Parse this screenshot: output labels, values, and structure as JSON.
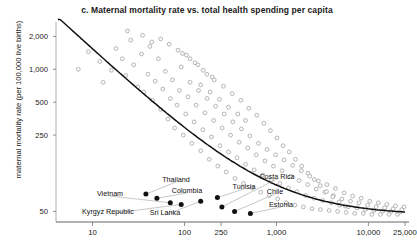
{
  "chart_data": {
    "type": "scatter",
    "title": "c. Maternal mortality rate vs. total health spending per capita",
    "xlabel": "",
    "ylabel": "maternal mortality rate (per 100,000 live births)",
    "xscale": "log",
    "yscale": "log",
    "xlim": [
      4,
      25000
    ],
    "ylim": [
      40,
      2600
    ],
    "grid": false,
    "legend": "none",
    "xticks": [
      10,
      100,
      250,
      1000,
      10000,
      25000
    ],
    "xtick_labels": [
      "10",
      "100",
      "250",
      "1,000",
      "10,000",
      "25,000"
    ],
    "yticks": [
      50,
      250,
      500,
      1000,
      2000
    ],
    "ytick_labels": [
      "50",
      "250",
      "500",
      "1,000",
      "2,000"
    ],
    "series": [
      {
        "name": "countries",
        "marker": "open-circle",
        "color": "#a8a8a8",
        "points": [
          [
            7,
            1000
          ],
          [
            9,
            1450
          ],
          [
            12,
            1180
          ],
          [
            13,
            760
          ],
          [
            16,
            980
          ],
          [
            18,
            1550
          ],
          [
            21,
            1250
          ],
          [
            23,
            880
          ],
          [
            26,
            1850
          ],
          [
            28,
            1100
          ],
          [
            31,
            690
          ],
          [
            34,
            1380
          ],
          [
            36,
            620
          ],
          [
            40,
            900
          ],
          [
            42,
            1620
          ],
          [
            45,
            520
          ],
          [
            48,
            780
          ],
          [
            52,
            1250
          ],
          [
            55,
            430
          ],
          [
            58,
            660
          ],
          [
            62,
            960
          ],
          [
            66,
            350
          ],
          [
            70,
            540
          ],
          [
            74,
            800
          ],
          [
            78,
            290
          ],
          [
            83,
            470
          ],
          [
            88,
            640
          ],
          [
            92,
            1050
          ],
          [
            97,
            250
          ],
          [
            103,
            390
          ],
          [
            109,
            560
          ],
          [
            115,
            760
          ],
          [
            120,
            210
          ],
          [
            127,
            330
          ],
          [
            134,
            470
          ],
          [
            142,
            640
          ],
          [
            150,
            180
          ],
          [
            158,
            280
          ],
          [
            167,
            400
          ],
          [
            176,
            540
          ],
          [
            186,
            150
          ],
          [
            196,
            240
          ],
          [
            207,
            340
          ],
          [
            218,
            460
          ],
          [
            230,
            130
          ],
          [
            243,
            200
          ],
          [
            256,
            290
          ],
          [
            270,
            390
          ],
          [
            285,
            115
          ],
          [
            301,
            175
          ],
          [
            317,
            250
          ],
          [
            335,
            330
          ],
          [
            353,
            100
          ],
          [
            373,
            155
          ],
          [
            393,
            215
          ],
          [
            415,
            285
          ],
          [
            438,
            90
          ],
          [
            462,
            135
          ],
          [
            487,
            190
          ],
          [
            514,
            245
          ],
          [
            542,
            82
          ],
          [
            572,
            120
          ],
          [
            604,
            165
          ],
          [
            637,
            210
          ],
          [
            672,
            75
          ],
          [
            709,
            108
          ],
          [
            748,
            145
          ],
          [
            789,
            185
          ],
          [
            833,
            70
          ],
          [
            879,
            98
          ],
          [
            927,
            130
          ],
          [
            978,
            165
          ],
          [
            1032,
            65
          ],
          [
            1089,
            90
          ],
          [
            1149,
            118
          ],
          [
            1212,
            148
          ],
          [
            1279,
            60
          ],
          [
            1349,
            82
          ],
          [
            1424,
            105
          ],
          [
            1502,
            132
          ],
          [
            1585,
            57
          ],
          [
            1672,
            76
          ],
          [
            1764,
            96
          ],
          [
            1861,
            118
          ],
          [
            1964,
            55
          ],
          [
            2072,
            70
          ],
          [
            2186,
            88
          ],
          [
            2306,
            105
          ],
          [
            2433,
            53
          ],
          [
            2567,
            66
          ],
          [
            2708,
            80
          ],
          [
            2857,
            95
          ],
          [
            3014,
            52
          ],
          [
            3180,
            63
          ],
          [
            3355,
            75
          ],
          [
            3540,
            88
          ],
          [
            3735,
            51
          ],
          [
            3940,
            60
          ],
          [
            4157,
            70
          ],
          [
            4386,
            81
          ],
          [
            4627,
            50
          ],
          [
            4881,
            57
          ],
          [
            5150,
            65
          ],
          [
            5433,
            74
          ],
          [
            5732,
            49
          ],
          [
            6047,
            55
          ],
          [
            6380,
            62
          ],
          [
            6731,
            69
          ],
          [
            7102,
            48
          ],
          [
            7493,
            54
          ],
          [
            7905,
            60
          ],
          [
            8340,
            66
          ],
          [
            8799,
            48
          ],
          [
            9283,
            52
          ],
          [
            9794,
            57
          ],
          [
            10333,
            62
          ],
          [
            10901,
            47
          ],
          [
            11500,
            51
          ],
          [
            12132,
            55
          ],
          [
            12800,
            60
          ],
          [
            13504,
            47
          ],
          [
            14247,
            50
          ],
          [
            15031,
            54
          ],
          [
            15857,
            58
          ],
          [
            16730,
            47
          ],
          [
            17650,
            50
          ],
          [
            18621,
            53
          ],
          [
            19645,
            56
          ],
          [
            20726,
            47
          ],
          [
            21866,
            49
          ],
          [
            23069,
            52
          ],
          [
            24338,
            55
          ],
          [
            55,
            1900
          ],
          [
            68,
            1700
          ],
          [
            85,
            1500
          ],
          [
            105,
            1350
          ],
          [
            130,
            1150
          ],
          [
            160,
            980
          ],
          [
            200,
            850
          ],
          [
            35,
            2050
          ],
          [
            44,
            1780
          ],
          [
            24,
            2250
          ],
          [
            150,
            720
          ],
          [
            190,
            620
          ],
          [
            240,
            530
          ],
          [
            300,
            450
          ],
          [
            380,
            390
          ],
          [
            460,
            340
          ],
          [
            95,
            1400
          ],
          [
            115,
            1250
          ],
          [
            140,
            1100
          ],
          [
            175,
            900
          ],
          [
            210,
            800
          ],
          [
            265,
            700
          ],
          [
            330,
            600
          ],
          [
            410,
            520
          ],
          [
            500,
            440
          ],
          [
            610,
            380
          ],
          [
            730,
            320
          ],
          [
            860,
            275
          ],
          [
            1010,
            235
          ],
          [
            1180,
            200
          ],
          [
            1380,
            175
          ],
          [
            1610,
            150
          ],
          [
            1880,
            130
          ],
          [
            2200,
            112
          ],
          [
            2580,
            98
          ],
          [
            3000,
            86
          ],
          [
            3500,
            76
          ],
          [
            4100,
            68
          ],
          [
            4800,
            61
          ],
          [
            5600,
            56
          ]
        ]
      },
      {
        "name": "highlighted-countries",
        "marker": "filled-circle",
        "color": "#111111",
        "points": [
          {
            "label": "Kyrgyz Republic",
            "x": 38,
            "y": 72
          },
          {
            "label": "Vietnam",
            "x": 50,
            "y": 66
          },
          {
            "label": "Sri Lanka",
            "x": 70,
            "y": 60
          },
          {
            "label": "Thailand",
            "x": 92,
            "y": 58
          },
          {
            "label": "Colombia",
            "x": 150,
            "y": 62
          },
          {
            "label": "Tunisia",
            "x": 228,
            "y": 67
          },
          {
            "label": "Costa Rica",
            "x": 255,
            "y": 55
          },
          {
            "label": "Chile",
            "x": 350,
            "y": 50
          },
          {
            "label": "Estonia",
            "x": 520,
            "y": 48
          }
        ]
      }
    ],
    "trendline": {
      "name": "fitted-curve",
      "color": "#111111",
      "description": "downward sloping fitted curve flattening toward the right"
    },
    "point_labels": [
      {
        "text": "Thailand",
        "x": 176,
        "y": 179
      },
      {
        "text": "Colombia",
        "x": 187,
        "y": 190
      },
      {
        "text": "Vietnam",
        "x": 110,
        "y": 193
      },
      {
        "text": "Kyrgyz Republic",
        "x": 108,
        "y": 211
      },
      {
        "text": "Sri Lanka",
        "x": 165,
        "y": 212
      },
      {
        "text": "Tunisia",
        "x": 244,
        "y": 186
      },
      {
        "text": "Costa Rica",
        "x": 277,
        "y": 176
      },
      {
        "text": "Chile",
        "x": 275,
        "y": 191
      },
      {
        "text": "Estonia",
        "x": 281,
        "y": 204
      }
    ]
  }
}
